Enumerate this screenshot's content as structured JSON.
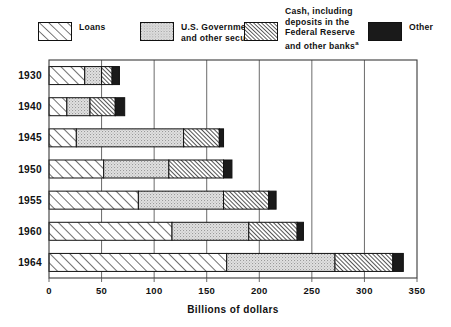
{
  "legend": {
    "items": [
      {
        "key": "loans",
        "label": "Loans",
        "pattern": "diagonal-hatch-up",
        "icon": "legend-swatch-loans"
      },
      {
        "key": "govt",
        "label": "U.S. Government\nand other securities",
        "pattern": "light-stipple",
        "icon": "legend-swatch-government"
      },
      {
        "key": "cash",
        "label": "Cash, including\ndeposits in the\nFederal Reserve\nand other banks",
        "footnote": "a",
        "pattern": "dense-diagonal-hatch",
        "icon": "legend-swatch-cash"
      },
      {
        "key": "other",
        "label": "Other",
        "pattern": "solid-black",
        "icon": "legend-swatch-other"
      }
    ]
  },
  "axis": {
    "x_title": "Billions of dollars",
    "x_ticks": [
      "0",
      "50",
      "100",
      "150",
      "200",
      "250",
      "300",
      "350"
    ],
    "x_tick_values": [
      0,
      50,
      100,
      150,
      200,
      250,
      300,
      350
    ]
  },
  "years": [
    "1930",
    "1940",
    "1945",
    "1950",
    "1955",
    "1960",
    "1964"
  ],
  "chart_data": {
    "type": "bar",
    "orientation": "horizontal",
    "stacked": true,
    "title": "",
    "subtitle": "",
    "xlabel": "Billions of dollars",
    "ylabel": "",
    "xlim": [
      0,
      350
    ],
    "grid": true,
    "grid_axis": "x",
    "legend_position": "top",
    "categories": [
      "1930",
      "1940",
      "1945",
      "1950",
      "1955",
      "1960",
      "1964"
    ],
    "series": [
      {
        "name": "Loans",
        "values": [
          34,
          17,
          26,
          52,
          85,
          117,
          169
        ]
      },
      {
        "name": "U.S. Government and other securities",
        "values": [
          16,
          22,
          102,
          62,
          81,
          73,
          103
        ]
      },
      {
        "name": "Cash, including deposits in the Federal Reserve and other banks",
        "values": [
          10,
          24,
          34,
          52,
          43,
          46,
          55
        ]
      },
      {
        "name": "Other",
        "values": [
          7,
          9,
          4,
          8,
          7,
          6,
          10
        ]
      }
    ],
    "totals": [
      67,
      72,
      166,
      174,
      216,
      242,
      337
    ],
    "footnotes": [
      "a"
    ]
  },
  "colors": {
    "ink": "#111111",
    "grid": "#5a5a5a",
    "background": "#ffffff",
    "stipple_fill": "#dcdcdc",
    "solid_black": "#1a1a1a"
  }
}
